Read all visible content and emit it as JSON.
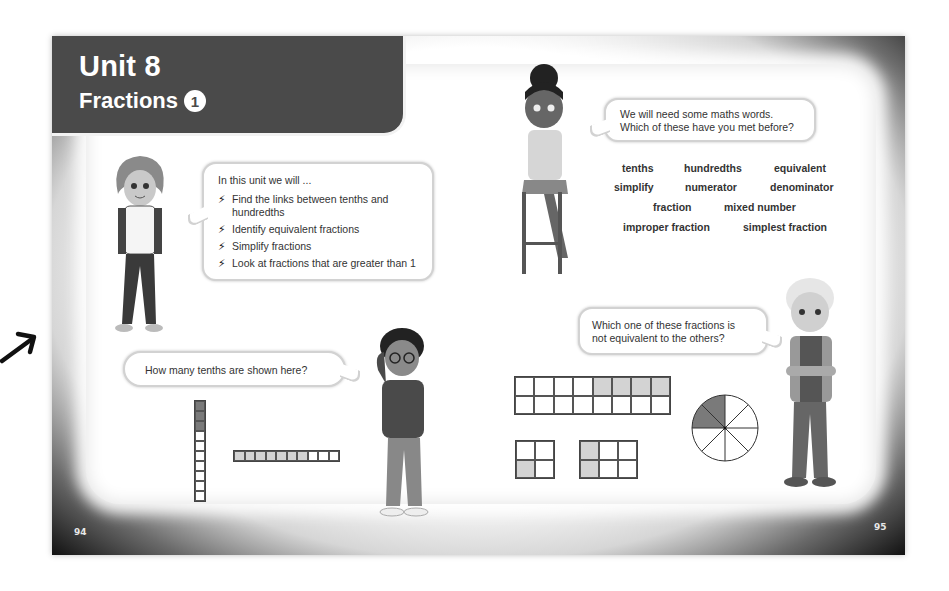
{
  "arrow_icon": "arrow-up-right-icon",
  "banner": {
    "title": "Unit 8",
    "subtitle": "Fractions",
    "badge": "1"
  },
  "page_numbers": {
    "left": "94",
    "right": "95"
  },
  "intro_bubble": {
    "heading": "In this unit we will ...",
    "bullet_icon": "lightning-bolt-icon",
    "items": [
      "Find the links between tenths and hundredths",
      "Identify equivalent fractions",
      "Simplify fractions",
      "Look at fractions that are greater than 1"
    ]
  },
  "vocab_bubble": {
    "line1": "We will need some maths words.",
    "line2": "Which of these have you met before?"
  },
  "vocab_words": [
    "tenths",
    "hundredths",
    "equivalent",
    "simplify",
    "numerator",
    "denominator",
    "fraction",
    "mixed number",
    "improper fraction",
    "simplest fraction"
  ],
  "tenths_bubble": {
    "text": "How many tenths are shown here?"
  },
  "equiv_bubble": {
    "line1": "Which one of these fractions is",
    "line2": "not equivalent to the others?"
  },
  "figures": {
    "vertical_strip": {
      "cells": 10,
      "shaded": 3,
      "shade_color": "#7a7a7a"
    },
    "horizontal_strip": {
      "cells": 10,
      "shaded": 7,
      "shade_color": "#d3d3d3"
    },
    "grid_8x2": {
      "cols": 8,
      "rows": 2,
      "shaded": "top row, right 4 cells"
    },
    "grid_2x2": {
      "cols": 2,
      "rows": 2,
      "shaded": "bottom-left cell"
    },
    "grid_3x2": {
      "cols": 3,
      "rows": 2,
      "shaded": "left column"
    },
    "pie": {
      "slices": 8,
      "shaded": 2
    }
  },
  "colors": {
    "banner": "#4a4a4a",
    "frame_dark": "#111111",
    "light_shade": "#d3d3d3",
    "dark_shade": "#7a7a7a"
  }
}
